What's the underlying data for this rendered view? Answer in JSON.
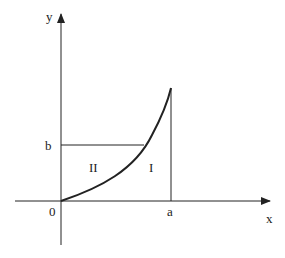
{
  "diagram": {
    "axes": {
      "x_label": "x",
      "y_label": "y",
      "origin_label": "0"
    },
    "marks": {
      "x_mark": "a",
      "y_mark": "b"
    },
    "regions": {
      "region_1": "I",
      "region_2": "II"
    },
    "colors": {
      "stroke": "#222222",
      "background": "#ffffff"
    }
  }
}
